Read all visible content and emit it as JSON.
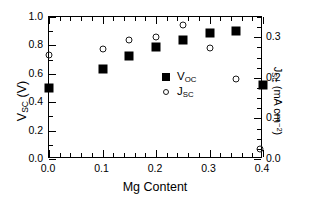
{
  "chart_data": {
    "type": "scatter",
    "title": "",
    "xlabel": "Mg Content",
    "ylabel": "V_SC (V)",
    "ylabel_right": "J_SC (mA cm^-2)",
    "xlim": [
      0.0,
      0.4
    ],
    "ylim": [
      0.0,
      1.0
    ],
    "ylim_right": [
      0.0,
      0.35
    ],
    "grid": false,
    "legend_position": "center",
    "x_ticks": [
      "0.0",
      "0.1",
      "0.2",
      "0.3",
      "0.4"
    ],
    "x_tick_values": [
      0.0,
      0.1,
      0.2,
      0.3,
      0.4
    ],
    "x_minor_step": 0.02,
    "y_ticks": [
      "0.0",
      "0.2",
      "0.4",
      "0.6",
      "0.8",
      "1.0"
    ],
    "y_tick_values": [
      0.0,
      0.2,
      0.4,
      0.6,
      0.8,
      1.0
    ],
    "y_minor_step": 0.1,
    "y2_ticks": [
      "0.0",
      "0.1",
      "0.2",
      "0.3"
    ],
    "y2_tick_values": [
      0.0,
      0.1,
      0.2,
      0.3
    ],
    "y2_minor_step": 0.025,
    "series": [
      {
        "name": "V_OC",
        "marker": "filled-square",
        "axis": "left",
        "x": [
          0.0,
          0.1,
          0.15,
          0.2,
          0.25,
          0.3,
          0.35,
          0.4
        ],
        "values": [
          0.5,
          0.635,
          0.725,
          0.79,
          0.84,
          0.885,
          0.9,
          0.52
        ]
      },
      {
        "name": "J_SC",
        "marker": "open-circle",
        "axis": "right",
        "x": [
          0.0,
          0.1,
          0.15,
          0.2,
          0.25,
          0.3,
          0.35,
          0.395
        ],
        "values": [
          0.257,
          0.27,
          0.294,
          0.301,
          0.331,
          0.273,
          0.196,
          0.024
        ],
        "values_left_scale": [
          0.735,
          0.77,
          0.84,
          0.86,
          0.945,
          0.78,
          0.56,
          0.07
        ]
      }
    ]
  },
  "axis_titles": {
    "x": "Mg Content",
    "y_left_main": "V",
    "y_left_sub": "SC",
    "y_left_unit": "(V)",
    "y_right_main": "J",
    "y_right_sub": "SC",
    "y_right_unit": "(mA cm",
    "y_right_exp": "−2",
    "y_right_close": ")"
  },
  "legend": {
    "entries": [
      {
        "label_main": "V",
        "label_sub": "OC",
        "marker": "filled-square"
      },
      {
        "label_main": "J",
        "label_sub": "SC",
        "marker": "open-circle"
      }
    ]
  },
  "colors": {
    "axis": "#000000",
    "voc_marker": "#000000",
    "jsc_marker": "#1a1a1a",
    "background": "#ffffff"
  }
}
